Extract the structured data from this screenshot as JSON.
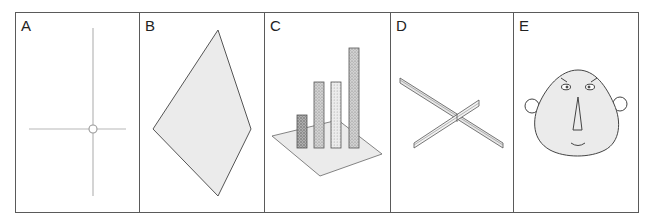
{
  "figure": {
    "panels": [
      {
        "id": "A",
        "label": "A",
        "content": "crosshair with center circle"
      },
      {
        "id": "B",
        "label": "B",
        "content": "kite quadrilateral"
      },
      {
        "id": "C",
        "label": "C",
        "content": "3D bar chart on plane"
      },
      {
        "id": "D",
        "label": "D",
        "content": "two crossed 3D blades"
      },
      {
        "id": "E",
        "label": "E",
        "content": "cartoon face"
      }
    ],
    "colors": {
      "border": "#5a5a5a",
      "stroke": "#444444",
      "light_stroke": "#b8b8b8",
      "fill": "#ebebeb",
      "bar_dark": "#9a9a9a",
      "bar_mid": "#c4c4c4",
      "bar_light": "#dedede"
    }
  }
}
